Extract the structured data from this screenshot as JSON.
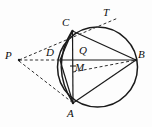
{
  "figure": {
    "kind": "geometry-diagram",
    "stroke_color": "#1a1a1a",
    "dashed_color": "#3a3a3a",
    "background_color": "#fdfdfd",
    "canvas": {
      "width": 152,
      "height": 127
    },
    "circle": {
      "cx": 97.5,
      "cy": 67,
      "r": 40
    },
    "points": [
      {
        "id": "T",
        "label": "T",
        "x": 119,
        "y": 18,
        "label_x": 103,
        "label_y": 8,
        "on_circle": false
      },
      {
        "id": "C",
        "label": "C",
        "x": 72,
        "y": 31,
        "label_x": 62,
        "label_y": 18,
        "on_circle": true
      },
      {
        "id": "Q",
        "label": "Q",
        "x": 86,
        "y": 60,
        "label_x": 79,
        "label_y": 47,
        "on_circle": false
      },
      {
        "id": "B",
        "label": "B",
        "x": 136,
        "y": 60,
        "label_x": 139,
        "label_y": 49,
        "on_circle": true
      },
      {
        "id": "P",
        "label": "P",
        "x": 19,
        "y": 60,
        "label_x": 6,
        "label_y": 50,
        "on_circle": false
      },
      {
        "id": "D",
        "label": "D",
        "x": 63,
        "y": 60,
        "label_x": 48,
        "label_y": 48,
        "on_circle": false
      },
      {
        "id": "M",
        "label": "M",
        "x": 73,
        "y": 72,
        "label_x": 76,
        "label_y": 62,
        "on_circle": false
      },
      {
        "id": "A",
        "label": "A",
        "x": 73,
        "y": 103,
        "label_x": 67,
        "label_y": 110,
        "on_circle": true
      }
    ],
    "solid_segments": [
      {
        "name": "chord-C-A",
        "from": "C",
        "to": "A"
      },
      {
        "name": "chord-C-B",
        "from": "C",
        "to": "B"
      },
      {
        "name": "chord-A-B",
        "from": "A",
        "to": "B"
      },
      {
        "name": "segment-D-B",
        "from": "D",
        "to": "B"
      },
      {
        "name": "chord-C-D",
        "from": "C",
        "to": "D"
      },
      {
        "name": "chord-D-A",
        "from": "D",
        "to": "A"
      }
    ],
    "dashed_segments": [
      {
        "name": "ray-P-to-C-to-T",
        "from": "P",
        "to": "T"
      },
      {
        "name": "segment-P-to-D",
        "from": "P",
        "to": "D"
      },
      {
        "name": "segment-P-to-A",
        "from": "P",
        "to": "A"
      },
      {
        "name": "segment-M-to-B",
        "from": "M",
        "to": "B"
      }
    ],
    "arc_C_D_A": {
      "name": "left-arc-through-D",
      "path": "M 72 31 Q 52 67 73 103"
    },
    "tick_marks": [
      {
        "name": "tick-on-CA-above-M",
        "x": 73,
        "y": 67
      }
    ]
  }
}
